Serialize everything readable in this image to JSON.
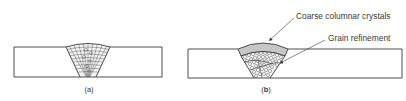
{
  "figure": {
    "panels": [
      {
        "id": "a",
        "caption": "(a)",
        "caption_open": "(",
        "caption_letter": "a",
        "caption_close": ")",
        "description": "Weld bead with columnar grain structure throughout"
      },
      {
        "id": "b",
        "caption": "(b)",
        "caption_open": "(",
        "caption_letter": "b",
        "caption_close": ")",
        "description": "Weld bead with coarse columnar crystals in top pass and grain refinement below",
        "annotations": [
          {
            "label": "Coarse columnar crystals"
          },
          {
            "label": "Grain refinement"
          }
        ]
      }
    ],
    "colors": {
      "line": "#3a3a3a",
      "text": "#3a3a3a",
      "background": "#ffffff"
    }
  }
}
